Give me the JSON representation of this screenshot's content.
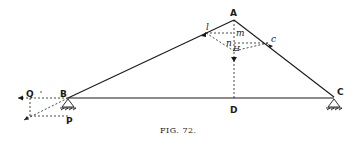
{
  "figure": {
    "caption": "FIG. 72.",
    "points": {
      "A": "A",
      "B": "B",
      "C": "C",
      "D": "D",
      "P": "P",
      "Q": "Q",
      "l": "l",
      "m": "m",
      "n": "n",
      "H": "H",
      "c": "c"
    },
    "colors": {
      "ink": "#1a1a1a",
      "background": "#ffffff"
    }
  }
}
